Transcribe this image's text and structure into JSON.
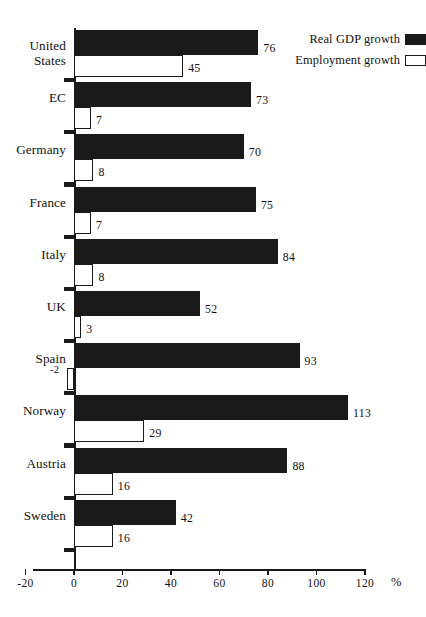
{
  "chart_data": {
    "type": "bar",
    "orientation": "horizontal",
    "title": "",
    "xlabel": "%",
    "ylabel": "",
    "xlim": [
      -20,
      120
    ],
    "xticks": [
      -20,
      0,
      20,
      40,
      60,
      80,
      100,
      120
    ],
    "xticklabels": [
      "-20",
      "0",
      "20",
      "40",
      "60",
      "80",
      "100",
      "120"
    ],
    "grid": false,
    "legend_position": "top-right",
    "categories": [
      "United\nStates",
      "EC",
      "Germany",
      "France",
      "Italy",
      "UK",
      "Spain",
      "Norway",
      "Austria",
      "Sweden"
    ],
    "series": [
      {
        "name": "Real GDP growth",
        "style": "filled",
        "color": "#1a1a1a",
        "values": [
          76,
          73,
          70,
          75,
          84,
          52,
          93,
          113,
          88,
          42
        ],
        "labels": [
          "76",
          "73",
          "70",
          "75",
          "84",
          "52",
          "93",
          "113",
          "88",
          "42"
        ]
      },
      {
        "name": "Employment growth",
        "style": "hollow",
        "color": "#ffffff",
        "values": [
          45,
          7,
          8,
          7,
          8,
          3,
          -2,
          29,
          16,
          16
        ],
        "labels": [
          "45",
          "7",
          "8",
          "7",
          "8",
          "3",
          "-2",
          "29",
          "16",
          "16"
        ]
      }
    ]
  },
  "legend": {
    "items": [
      {
        "label": "Real GDP growth",
        "swatch": "filled"
      },
      {
        "label": "Employment growth",
        "swatch": "hollow"
      }
    ]
  },
  "axis": {
    "unit": "%"
  }
}
